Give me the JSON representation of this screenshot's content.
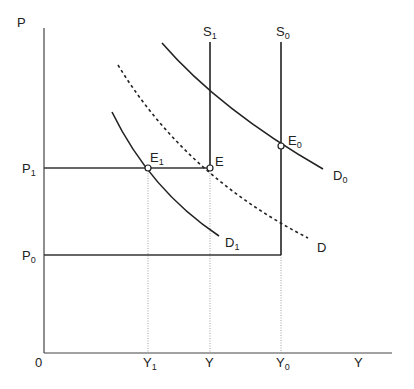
{
  "axes": {
    "y_label": "P",
    "x_label": "Y",
    "origin_label": "0",
    "y_ticks": [
      {
        "main": "P",
        "sub": "1"
      },
      {
        "main": "P",
        "sub": "0"
      }
    ],
    "x_ticks": [
      {
        "main": "Y",
        "sub": "1"
      },
      {
        "main": "Y",
        "sub": ""
      },
      {
        "main": "Y",
        "sub": "0"
      }
    ]
  },
  "curves": {
    "S1": {
      "main": "S",
      "sub": "1"
    },
    "S0": {
      "main": "S",
      "sub": "0"
    },
    "D0": {
      "main": "D",
      "sub": "0"
    },
    "D1": {
      "main": "D",
      "sub": "1"
    },
    "D": {
      "main": "D",
      "sub": ""
    }
  },
  "points": {
    "E1": {
      "main": "E",
      "sub": "1"
    },
    "E": {
      "main": "E",
      "sub": ""
    },
    "E0": {
      "main": "E",
      "sub": "0"
    }
  },
  "colors": {
    "line": "#222222",
    "guide": "#888888"
  }
}
